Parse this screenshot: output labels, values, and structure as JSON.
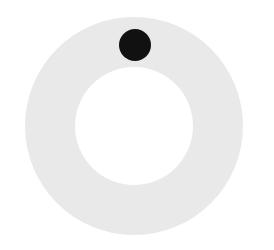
{
  "diagram": {
    "canvas": {
      "width": 274,
      "height": 250,
      "background": "#ffffff"
    },
    "ring": {
      "cx": 134,
      "cy": 126,
      "outer_radius": 109,
      "inner_radius": 59,
      "color": "#e9e9e9"
    },
    "dot": {
      "cx": 135,
      "cy": 45,
      "radius": 16,
      "color": "#111111"
    }
  }
}
